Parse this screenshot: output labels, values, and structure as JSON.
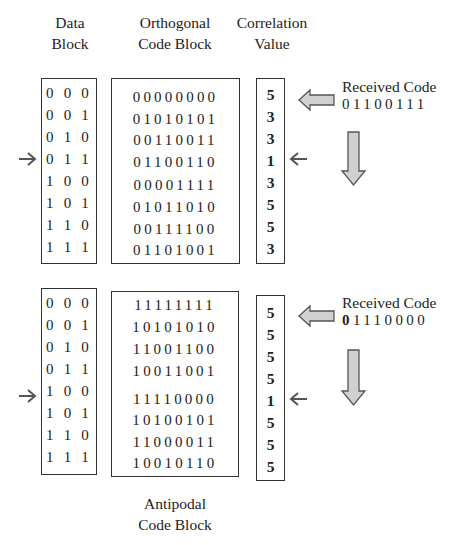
{
  "headers": {
    "data_block": [
      "Data",
      "Block"
    ],
    "orthogonal_block": [
      "Orthogonal",
      "Code Block"
    ],
    "correlation": [
      "Correlation",
      "Value"
    ],
    "antipodal_block": [
      "Antipodal",
      "Code Block"
    ]
  },
  "data_block": [
    "0 0 0",
    "0 0 1",
    "0 1 0",
    "0 1 1",
    "1 0 0",
    "1 0 1",
    "1 1 0",
    "1 1 1"
  ],
  "top": {
    "codes": [
      "00000000",
      "01010101",
      "00110011",
      "01100110",
      "00001111",
      "01011010",
      "00111100",
      "01101001"
    ],
    "correlation": [
      "5",
      "3",
      "3",
      "1",
      "3",
      "5",
      "5",
      "3"
    ],
    "received_title": "Received Code",
    "received_code_bold": "",
    "received_code_rest": "01100111",
    "selected_row_index": 3
  },
  "bottom": {
    "codes": [
      "11111111",
      "10101010",
      "11001100",
      "10011001",
      "11110000",
      "10100101",
      "11000011",
      "10010110"
    ],
    "correlation": [
      "5",
      "5",
      "5",
      "5",
      "1",
      "5",
      "5",
      "5"
    ],
    "received_title": "Received Code",
    "received_code_bold": "0",
    "received_code_rest": "1110000",
    "selected_row_index": 4
  },
  "colors": {
    "border": "#333333",
    "arrow_fill": "#d0d0d0",
    "arrow_stroke": "#555555",
    "pointer": "#555555"
  }
}
